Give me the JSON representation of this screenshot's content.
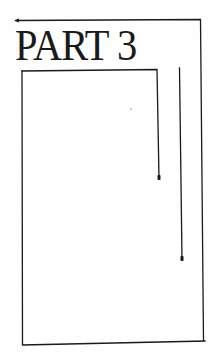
{
  "page": {
    "title": "PART 3"
  },
  "colors": {
    "ink": "#1a1a1a",
    "paper": "#fefefe"
  }
}
